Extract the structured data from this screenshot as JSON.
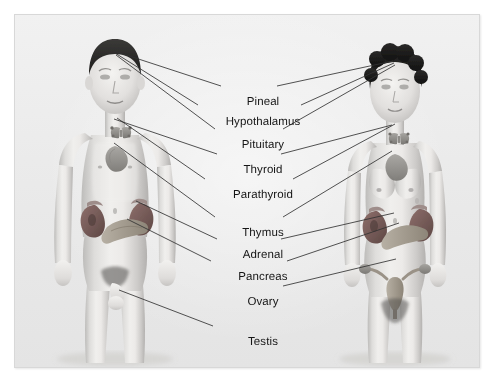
{
  "figure": {
    "caption_sliver": "Figure: The endocrine system",
    "panel": {
      "background_color": "#eeeeee",
      "border_color": "#d8d8d8"
    },
    "leader_line_color": "#333333",
    "label_color": "#161616"
  },
  "subjects": [
    {
      "id": "male",
      "name": "male-figure",
      "side": "left",
      "label": "Male figure"
    },
    {
      "id": "female",
      "name": "female-figure",
      "side": "right",
      "label": "Female figure"
    }
  ],
  "labels": [
    {
      "id": "pineal",
      "text": "Pineal",
      "x": 248,
      "y": 87,
      "anchors": [
        {
          "subject": "male",
          "x": 113,
          "y": 50
        },
        {
          "subject": "female",
          "x": 392,
          "y": 60
        }
      ]
    },
    {
      "id": "hypothalamus",
      "text": "Hypothalamus",
      "x": 248,
      "y": 107,
      "anchors": [
        {
          "subject": "male",
          "x": 114,
          "y": 52
        },
        {
          "subject": "female",
          "x": 393,
          "y": 62
        }
      ]
    },
    {
      "id": "pituitary",
      "text": "Pituitary",
      "x": 248,
      "y": 130,
      "anchors": [
        {
          "subject": "male",
          "x": 115,
          "y": 54
        },
        {
          "subject": "female",
          "x": 394,
          "y": 64
        }
      ]
    },
    {
      "id": "thyroid",
      "text": "Thyroid",
      "x": 248,
      "y": 155,
      "anchors": [
        {
          "subject": "male",
          "x": 113,
          "y": 118
        },
        {
          "subject": "female",
          "x": 391,
          "y": 124
        }
      ]
    },
    {
      "id": "parathyroid",
      "text": "Parathyroid",
      "x": 248,
      "y": 180,
      "anchors": [
        {
          "subject": "male",
          "x": 116,
          "y": 117
        },
        {
          "subject": "female",
          "x": 394,
          "y": 123
        }
      ]
    },
    {
      "id": "thymus",
      "text": "Thymus",
      "x": 248,
      "y": 218,
      "anchors": [
        {
          "subject": "male",
          "x": 113,
          "y": 142
        },
        {
          "subject": "female",
          "x": 391,
          "y": 150
        }
      ]
    },
    {
      "id": "adrenal",
      "text": "Adrenal",
      "x": 248,
      "y": 240,
      "anchors": [
        {
          "subject": "male",
          "x": 135,
          "y": 200
        },
        {
          "subject": "female",
          "x": 393,
          "y": 212
        }
      ]
    },
    {
      "id": "pancreas",
      "text": "Pancreas",
      "x": 248,
      "y": 262,
      "anchors": [
        {
          "subject": "male",
          "x": 126,
          "y": 218
        },
        {
          "subject": "female",
          "x": 398,
          "y": 222
        }
      ]
    },
    {
      "id": "ovary",
      "text": "Ovary",
      "x": 248,
      "y": 287,
      "anchors": [
        {
          "subject": "female",
          "x": 395,
          "y": 258
        }
      ]
    },
    {
      "id": "testis",
      "text": "Testis",
      "x": 248,
      "y": 327,
      "anchors": [
        {
          "subject": "male",
          "x": 118,
          "y": 289
        }
      ]
    }
  ],
  "organs": {
    "male": [
      "pineal",
      "hypothalamus",
      "pituitary",
      "thyroid",
      "parathyroid",
      "thymus",
      "adrenal",
      "pancreas",
      "testis"
    ],
    "female": [
      "pineal",
      "hypothalamus",
      "pituitary",
      "thyroid",
      "parathyroid",
      "thymus",
      "adrenal",
      "pancreas",
      "ovary"
    ]
  }
}
